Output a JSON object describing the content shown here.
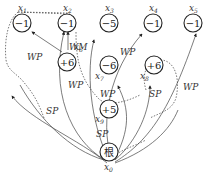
{
  "nodes": {
    "x0": {
      "id": "x0",
      "label": "x",
      "sub": "0",
      "value": "根"
    },
    "x1": {
      "id": "x1",
      "label": "x",
      "sub": "1",
      "value": "−1"
    },
    "x2": {
      "id": "x2",
      "label": "x",
      "sub": "2",
      "value": "−1"
    },
    "x3": {
      "id": "x3",
      "label": "x",
      "sub": "3",
      "value": "−5"
    },
    "x4": {
      "id": "x4",
      "label": "x",
      "sub": "4",
      "value": "−1"
    },
    "x5": {
      "id": "x5",
      "label": "x",
      "sub": "5",
      "value": "−1"
    },
    "x6": {
      "id": "x6",
      "label": "x",
      "sub": "6",
      "value": "+6"
    },
    "x7": {
      "id": "x7",
      "label": "x",
      "sub": "7",
      "value": "−6"
    },
    "x8": {
      "id": "x8",
      "label": "x",
      "sub": "8",
      "value": "+6"
    },
    "x9": {
      "id": "x9",
      "label": "x",
      "sub": "9",
      "value": "+5"
    }
  },
  "edge_labels": {
    "wp_x6_x1": "WP",
    "wm_x6_x2": "WM",
    "wp_x0_x2": "WP",
    "wp_x0_x7": "WP",
    "wp_x0_x4": "WP",
    "wp_x0_x5": "WP",
    "sp_left": "SP",
    "sp_x8": "SP",
    "sp_x9": "SP"
  }
}
